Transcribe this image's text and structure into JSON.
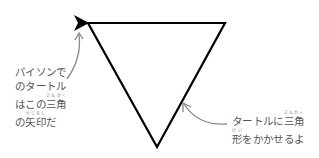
{
  "diagram": {
    "triangle": {
      "vertices": [
        [
          88,
          23
        ],
        [
          225,
          23
        ],
        [
          157,
          147
        ]
      ],
      "stroke": "#000000"
    },
    "turtle_arrow": {
      "tip": [
        75,
        23
      ],
      "color": "#000000"
    },
    "annotations": {
      "left": {
        "lines": [
          {
            "text": "パイソンで"
          },
          {
            "text": "のタートル"
          },
          {
            "pre": "はこの",
            "ruby_base": "三角",
            "ruby_text": "さんかく"
          },
          {
            "pre": "の",
            "ruby_base": "矢印",
            "ruby_text": "やじるし",
            "post": "だ"
          }
        ]
      },
      "right": {
        "lines": [
          {
            "pre": "タートルに",
            "ruby_base": "三角",
            "ruby_text": "さんかっ"
          },
          {
            "ruby_base": "形",
            "ruby_text": "けい",
            "post": "をかかせるよ"
          }
        ]
      }
    },
    "pointer_color": "#888888"
  }
}
